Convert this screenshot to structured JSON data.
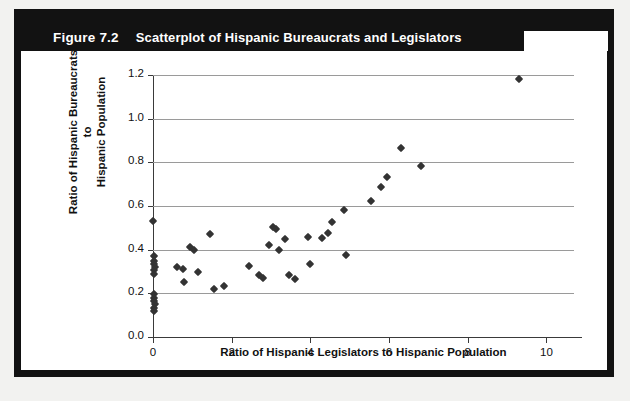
{
  "figure": {
    "label": "Figure 7.2",
    "title": "Scatterplot of Hispanic Bureaucrats and Legislators"
  },
  "chart_data": {
    "type": "scatter",
    "title": "Scatterplot of Hispanic Bureaucrats and Legislators",
    "xlabel": "Ratio of Hispanic Legislators to Hispanic Population",
    "ylabel": "Ratio of Hispanic Bureaucrats to Hispanic Population",
    "ylabel_lines": [
      "Ratio of Hispanic Bureaucrats to",
      "Hispanic Population"
    ],
    "xlim": [
      0,
      10.7
    ],
    "ylim": [
      0.0,
      1.2
    ],
    "xticks": [
      0,
      2,
      4,
      6,
      8,
      10
    ],
    "xtick_labels": [
      "0",
      "2",
      "4",
      "6",
      "8",
      "10"
    ],
    "yticks": [
      0.0,
      0.2,
      0.4,
      0.6,
      0.8,
      1.0,
      1.2
    ],
    "ytick_labels": [
      "0.0",
      "0.2",
      "0.4",
      "0.6",
      "0.8",
      "1.0",
      "1.2"
    ],
    "grid": "horizontal",
    "legend": null,
    "marker": "diamond",
    "marker_color": "#333333",
    "points": [
      [
        0.0,
        0.53
      ],
      [
        0.02,
        0.37
      ],
      [
        0.03,
        0.35
      ],
      [
        0.02,
        0.335
      ],
      [
        0.04,
        0.32
      ],
      [
        0.02,
        0.305
      ],
      [
        0.03,
        0.29
      ],
      [
        0.02,
        0.195
      ],
      [
        0.03,
        0.18
      ],
      [
        0.02,
        0.165
      ],
      [
        0.04,
        0.15
      ],
      [
        0.02,
        0.135
      ],
      [
        0.03,
        0.12
      ],
      [
        0.62,
        0.32
      ],
      [
        0.75,
        0.31
      ],
      [
        0.8,
        0.25
      ],
      [
        0.95,
        0.41
      ],
      [
        1.05,
        0.4
      ],
      [
        1.15,
        0.3
      ],
      [
        1.45,
        0.47
      ],
      [
        1.55,
        0.22
      ],
      [
        1.8,
        0.235
      ],
      [
        2.45,
        0.325
      ],
      [
        2.7,
        0.285
      ],
      [
        2.8,
        0.27
      ],
      [
        2.95,
        0.42
      ],
      [
        3.05,
        0.505
      ],
      [
        3.12,
        0.495
      ],
      [
        3.2,
        0.4
      ],
      [
        3.35,
        0.45
      ],
      [
        3.45,
        0.285
      ],
      [
        3.6,
        0.265
      ],
      [
        3.95,
        0.46
      ],
      [
        4.0,
        0.335
      ],
      [
        4.3,
        0.455
      ],
      [
        4.45,
        0.475
      ],
      [
        4.55,
        0.525
      ],
      [
        4.85,
        0.58
      ],
      [
        4.9,
        0.375
      ],
      [
        5.55,
        0.625
      ],
      [
        5.8,
        0.685
      ],
      [
        5.95,
        0.735
      ],
      [
        6.3,
        0.865
      ],
      [
        6.8,
        0.785
      ],
      [
        9.3,
        1.18
      ]
    ]
  }
}
